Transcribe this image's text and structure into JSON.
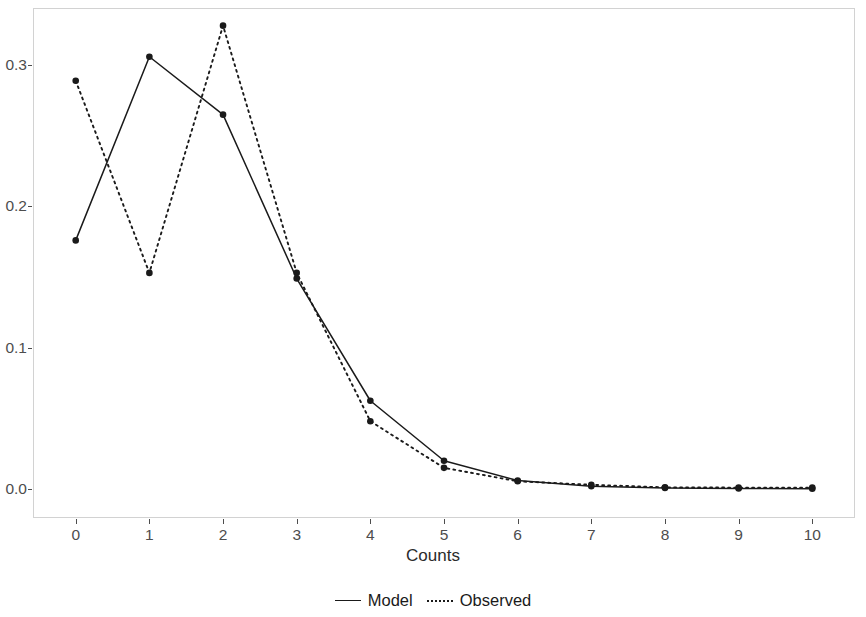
{
  "chart_data": {
    "type": "line",
    "title": "",
    "subtitle": "",
    "xlabel": "Counts",
    "ylabel": "",
    "x": [
      0,
      1,
      2,
      3,
      4,
      5,
      6,
      7,
      8,
      9,
      10
    ],
    "xticklabels": [
      "0",
      "1",
      "2",
      "3",
      "4",
      "5",
      "6",
      "7",
      "8",
      "9",
      "10"
    ],
    "yticks": [
      0.0,
      0.1,
      0.2,
      0.3
    ],
    "yticklabels": [
      "0.0",
      "0.1",
      "0.2",
      "0.3"
    ],
    "xlim": [
      -0.58,
      10.58
    ],
    "ylim": [
      -0.0205,
      0.3405
    ],
    "grid": false,
    "legend_position": "bottom",
    "series": [
      {
        "name": "Model",
        "linestyle": "solid",
        "marker": "circle",
        "color": "#1a1a1a",
        "values": [
          0.176,
          0.306,
          0.265,
          0.149,
          0.0625,
          0.02,
          0.006,
          0.002,
          0.0008,
          0.0004,
          0.0002
        ]
      },
      {
        "name": "Observed",
        "linestyle": "dotted",
        "marker": "circle",
        "color": "#1a1a1a",
        "values": [
          0.289,
          0.153,
          0.328,
          0.153,
          0.048,
          0.015,
          0.0055,
          0.003,
          0.0012,
          0.001,
          0.001
        ]
      }
    ]
  },
  "axis": {
    "x_title": "Counts"
  },
  "legend": {
    "entries": [
      {
        "label": "Model",
        "style": "solid"
      },
      {
        "label": "Observed",
        "style": "dotted"
      }
    ]
  },
  "style": {
    "panel_border": "#d2d2d2",
    "tick_label_color": "#4d4d4d",
    "series_color": "#1a1a1a",
    "background": "#ffffff"
  }
}
